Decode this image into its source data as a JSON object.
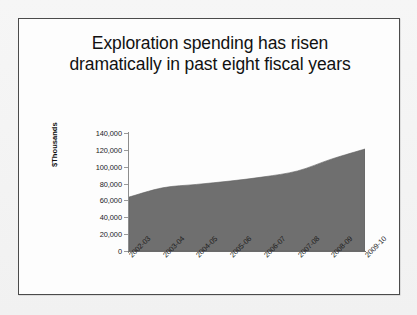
{
  "slide": {
    "title": "Exploration spending has risen\ndramatically in past eight fiscal years"
  },
  "colors": {
    "area_fill": "#6f6f6f",
    "area_edge": "#5f5f5f",
    "frame_border": "#4b4b4b",
    "plot_background": "#fdfdfd",
    "text": "#111111",
    "axis_line": "#6b6b6b",
    "page_background": "#f4f4f4"
  },
  "chart_data": {
    "type": "area",
    "title": "Exploration spending has risen dramatically in past eight fiscal years",
    "xlabel": "",
    "ylabel": "$Thousands",
    "categories": [
      "2002-03",
      "2003-04",
      "2004-05",
      "2005-06",
      "2006-07",
      "2007-08",
      "2008-09",
      "2009-10"
    ],
    "values": [
      64000,
      75000,
      79000,
      83000,
      88000,
      95000,
      109000,
      121000
    ],
    "ylim": [
      0,
      140000
    ],
    "ytick_values": [
      0,
      20000,
      40000,
      60000,
      80000,
      100000,
      120000,
      140000
    ],
    "ytick_labels": [
      "0",
      "20,000",
      "40,000",
      "60,000",
      "80,000",
      "100,000",
      "120,000",
      "140,000"
    ],
    "grid": false,
    "legend": false,
    "legend_position": "none",
    "series": [
      {
        "name": "Exploration spending",
        "values": [
          64000,
          75000,
          79000,
          83000,
          88000,
          95000,
          109000,
          121000
        ]
      }
    ]
  }
}
